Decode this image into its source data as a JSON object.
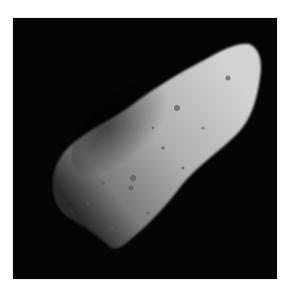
{
  "image": {
    "subject": "asteroid",
    "description": "Grayscale spacecraft photograph of an elongated, cratered asteroid against a black background",
    "colors": {
      "background": "#ffffff",
      "space": "#050505",
      "surface_light": "#c9c9c9",
      "surface_mid": "#8a8a8a",
      "surface_dark": "#2a2a2a"
    }
  }
}
